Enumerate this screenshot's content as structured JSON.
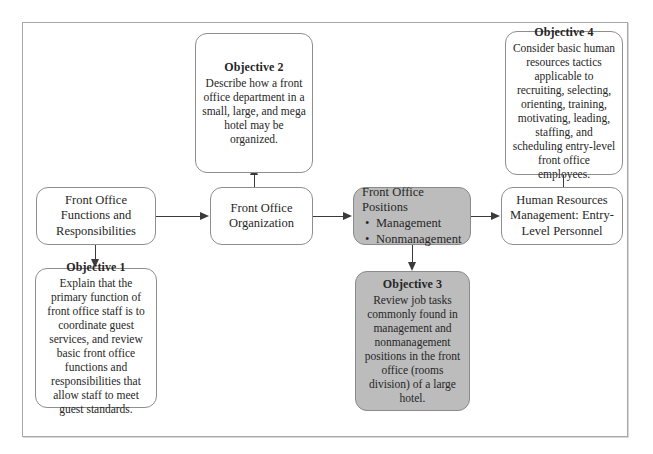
{
  "figure": {
    "kind": "flow-diagram",
    "frame_border_color": "#a8a8a8",
    "shaded_fill": "#bcbcbc",
    "connector_color": "#3a3a3a"
  },
  "nodes": {
    "functions": {
      "label": "Front Office Functions and Responsibilities",
      "shaded": false
    },
    "organization": {
      "label": "Front Office Organization",
      "shaded": false
    },
    "positions": {
      "title": "Front Office Positions",
      "bullets": [
        "Management",
        "Nonmanagement"
      ],
      "bullet_glyph": "•",
      "shaded": true
    },
    "hr": {
      "label": "Human Resources Management: Entry-Level Personnel",
      "shaded": false
    },
    "objective1": {
      "title": "Objective 1",
      "body": "Explain that the primary function of front office staff is to coordinate guest services, and review basic front office functions and responsibilities that allow staff to meet guest standards.",
      "shaded": false
    },
    "objective2": {
      "title": "Objective 2",
      "body": "Describe how a front office department in a small, large, and mega hotel may be organized.",
      "shaded": false
    },
    "objective3": {
      "title": "Objective 3",
      "body": "Review job tasks commonly found in management and nonmanagement positions in the front office (rooms division) of a large hotel.",
      "shaded": true
    },
    "objective4": {
      "title": "Objective 4",
      "body": "Consider basic human resources tactics applicable to recruiting, selecting, orienting, training, motivating, leading, staffing, and scheduling entry-level front office employees.",
      "shaded": false
    }
  },
  "connectors": [
    {
      "from": "functions",
      "to": "organization",
      "direction": "right"
    },
    {
      "from": "functions",
      "to": "objective1",
      "direction": "down"
    },
    {
      "from": "organization",
      "to": "objective2",
      "direction": "up"
    },
    {
      "from": "organization",
      "to": "positions",
      "direction": "right"
    },
    {
      "from": "positions",
      "to": "objective3",
      "direction": "down"
    },
    {
      "from": "positions",
      "to": "hr",
      "direction": "right"
    },
    {
      "from": "hr",
      "to": "objective4",
      "direction": "up"
    }
  ]
}
